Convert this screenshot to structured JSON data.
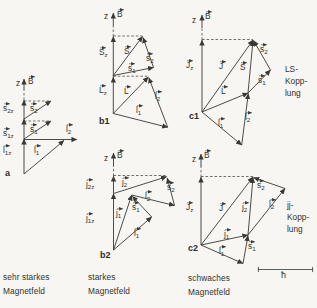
{
  "figure_colors": {
    "background": "#f7f6f2",
    "ink": "#3a3833"
  },
  "captions": [
    {
      "lines": [
        "sehr starkes",
        "Magnetfeld"
      ]
    },
    {
      "lines": [
        "starkes",
        "Magnetfeld"
      ]
    },
    {
      "lines": [
        "schwaches",
        "Magnetfeld"
      ]
    }
  ],
  "coupling": [
    {
      "lines": [
        "LS-",
        "Kopp-",
        "lung"
      ]
    },
    {
      "lines": [
        "jj-",
        "Kopp-",
        "lung"
      ]
    }
  ],
  "scale": {
    "label": "ħ",
    "x1": 258,
    "x2": 313,
    "y": 269.5
  },
  "panels": [
    {
      "id": "a",
      "tag": {
        "text": "a",
        "x": 5,
        "y": 167
      },
      "vectors": [
        {
          "name": "l1z-projection",
          "x1": 24,
          "y1": 174,
          "x2": 24,
          "y2": 139
        },
        {
          "name": "s1z-projection",
          "x1": 24,
          "y1": 139,
          "x2": 24,
          "y2": 119
        },
        {
          "name": "s2z-projection",
          "x1": 24,
          "y1": 119,
          "x2": 24,
          "y2": 100
        },
        {
          "name": "b-field-arrow",
          "x1": 24,
          "y1": 90,
          "x2": 24,
          "y2": 79
        },
        {
          "name": "s2-vector",
          "x1": 24,
          "y1": 119,
          "x2": 51,
          "y2": 101
        },
        {
          "name": "s1-vector",
          "x1": 24,
          "y1": 139,
          "x2": 51,
          "y2": 121
        },
        {
          "name": "l2-vector",
          "x1": 24,
          "y1": 139.5,
          "x2": 77,
          "y2": 139.5
        },
        {
          "name": "l1-vector",
          "x1": 24,
          "y1": 174,
          "x2": 64,
          "y2": 140.5
        }
      ],
      "dashes": [
        {
          "x1": 24,
          "y1": 100,
          "x2": 24,
          "y2": 90
        },
        {
          "x1": 24,
          "y1": 101,
          "x2": 51,
          "y2": 101
        },
        {
          "x1": 24,
          "y1": 121,
          "x2": 51,
          "y2": 121
        }
      ],
      "labels": [
        {
          "name": "z-axis-label",
          "x": 16,
          "y": 77,
          "base": "z"
        },
        {
          "name": "b-field-label",
          "x": 28,
          "y": 75,
          "base": "B",
          "vec": true
        },
        {
          "name": "s2z-label",
          "x": 3,
          "y": 102,
          "base": "s",
          "sub": "2z",
          "vec": true
        },
        {
          "name": "s1z-label",
          "x": 3,
          "y": 127,
          "base": "s",
          "sub": "1z",
          "vec": true
        },
        {
          "name": "l1z-label",
          "x": 3,
          "y": 144,
          "base": "l",
          "sub": "1z",
          "vec": true
        },
        {
          "name": "s2-label",
          "x": 30,
          "y": 102,
          "base": "s",
          "sub": "2",
          "vec": true
        },
        {
          "name": "s1-label",
          "x": 30,
          "y": 123,
          "base": "s",
          "sub": "1",
          "vec": true
        },
        {
          "name": "l2-label",
          "x": 66,
          "y": 123,
          "base": "l",
          "sub": "2",
          "vec": true
        },
        {
          "name": "l1-label",
          "x": 34,
          "y": 144,
          "base": "l",
          "sub": "1",
          "vec": true
        }
      ]
    },
    {
      "id": "b1",
      "tag": {
        "text": "b1",
        "x": 99,
        "y": 115
      },
      "vectors": [
        {
          "name": "Lz-projection",
          "x1": 113.3,
          "y1": 113.5,
          "x2": 113.3,
          "y2": 77
        },
        {
          "name": "Sz-projection",
          "x1": 113.3,
          "y1": 77,
          "x2": 113.3,
          "y2": 36.5
        },
        {
          "name": "b-field-arrow",
          "x1": 113.3,
          "y1": 26,
          "x2": 113.3,
          "y2": 13
        },
        {
          "name": "S-vector",
          "x1": 113.3,
          "y1": 75.5,
          "x2": 142.5,
          "y2": 36.5
        },
        {
          "name": "s1-vector",
          "x1": 113.3,
          "y1": 75.5,
          "x2": 153.5,
          "y2": 67.5
        },
        {
          "name": "s2-vector",
          "x1": 153.5,
          "y1": 67.5,
          "x2": 143,
          "y2": 37.5
        },
        {
          "name": "L-vector",
          "x1": 113.3,
          "y1": 113.5,
          "x2": 148.3,
          "y2": 77
        },
        {
          "name": "l1-vector",
          "x1": 113.3,
          "y1": 113.5,
          "x2": 167.7,
          "y2": 127.3
        },
        {
          "name": "l2-vector",
          "x1": 167.7,
          "y1": 127.3,
          "x2": 148.8,
          "y2": 77.8
        }
      ],
      "dashes": [
        {
          "x1": 113.3,
          "y1": 36.5,
          "x2": 113.3,
          "y2": 26
        },
        {
          "x1": 113.3,
          "y1": 36,
          "x2": 142.5,
          "y2": 36
        },
        {
          "x1": 113.3,
          "y1": 76.2,
          "x2": 148,
          "y2": 76.2
        }
      ],
      "labels": [
        {
          "name": "z-axis-label",
          "x": 104,
          "y": 10,
          "base": "z"
        },
        {
          "name": "b-field-label",
          "x": 117,
          "y": 8,
          "base": "B",
          "vec": true
        },
        {
          "name": "Sz-label",
          "x": 99,
          "y": 46,
          "base": "S",
          "sub": "z",
          "vec": true
        },
        {
          "name": "Lz-label",
          "x": 99,
          "y": 84,
          "base": "L",
          "sub": "z",
          "vec": true
        },
        {
          "name": "S-label",
          "x": 124,
          "y": 45,
          "base": "S",
          "vec": true
        },
        {
          "name": "s1-label",
          "x": 128,
          "y": 62,
          "base": "s",
          "sub": "1",
          "vec": true
        },
        {
          "name": "s2-label",
          "x": 146,
          "y": 52,
          "base": "s",
          "sub": "2",
          "vec": true
        },
        {
          "name": "L-label",
          "x": 124,
          "y": 85,
          "base": "L",
          "vec": true
        },
        {
          "name": "l1-label",
          "x": 136,
          "y": 104,
          "base": "l",
          "sub": "1",
          "vec": true
        },
        {
          "name": "l2-label",
          "x": 155,
          "y": 90,
          "base": "l",
          "sub": "2",
          "vec": true
        }
      ]
    },
    {
      "id": "b2",
      "tag": {
        "text": "b2",
        "x": 100,
        "y": 249
      },
      "vectors": [
        {
          "name": "j1z-projection",
          "x1": 113.5,
          "y1": 250,
          "x2": 113.5,
          "y2": 193.5
        },
        {
          "name": "j2z-projection",
          "x1": 113.5,
          "y1": 193.5,
          "x2": 113.5,
          "y2": 176
        },
        {
          "name": "b-field-arrow",
          "x1": 113.5,
          "y1": 166,
          "x2": 113.5,
          "y2": 153
        },
        {
          "name": "j2-vector",
          "x1": 113.5,
          "y1": 193.5,
          "x2": 166.7,
          "y2": 176.7
        },
        {
          "name": "j1-vector",
          "x1": 113.5,
          "y1": 250,
          "x2": 131.7,
          "y2": 195
        },
        {
          "name": "l2-vector",
          "x1": 131.7,
          "y1": 195,
          "x2": 174.5,
          "y2": 205.5
        },
        {
          "name": "s2-vector",
          "x1": 174.5,
          "y1": 205.5,
          "x2": 167.3,
          "y2": 178
        },
        {
          "name": "l1-vector",
          "x1": 113.5,
          "y1": 250,
          "x2": 151.7,
          "y2": 217
        },
        {
          "name": "s1-vector",
          "x1": 151.7,
          "y1": 217,
          "x2": 132.3,
          "y2": 196.2
        }
      ],
      "dashes": [
        {
          "x1": 113.5,
          "y1": 176,
          "x2": 113.5,
          "y2": 166
        },
        {
          "x1": 113.5,
          "y1": 175.5,
          "x2": 166.5,
          "y2": 175.5
        }
      ],
      "labels": [
        {
          "name": "z-axis-label",
          "x": 104,
          "y": 152,
          "base": "z"
        },
        {
          "name": "b-field-label",
          "x": 117,
          "y": 149,
          "base": "B",
          "vec": true
        },
        {
          "name": "j2z-label",
          "x": 86,
          "y": 178,
          "base": "j",
          "sub": "2z",
          "vec": true
        },
        {
          "name": "j1z-label",
          "x": 86,
          "y": 212,
          "base": "j",
          "sub": "1z",
          "vec": true
        },
        {
          "name": "j2-label",
          "x": 122,
          "y": 176,
          "base": "j",
          "sub": "2",
          "vec": true
        },
        {
          "name": "j1-label",
          "x": 116,
          "y": 207,
          "base": "j",
          "sub": "1",
          "vec": true
        },
        {
          "name": "l2-label",
          "x": 145,
          "y": 190,
          "base": "l",
          "sub": "2",
          "vec": true
        },
        {
          "name": "s2-label",
          "x": 167,
          "y": 181,
          "base": "s",
          "sub": "2",
          "vec": true
        },
        {
          "name": "s1-label",
          "x": 132,
          "y": 201,
          "base": "s",
          "sub": "1",
          "vec": true
        },
        {
          "name": "l1-label",
          "x": 134,
          "y": 227,
          "base": "l",
          "sub": "1",
          "vec": true
        }
      ]
    },
    {
      "id": "c1",
      "tag": {
        "text": "c1",
        "x": 189,
        "y": 110
      },
      "vectors": [
        {
          "name": "Jz-projection",
          "x1": 202,
          "y1": 112,
          "x2": 202,
          "y2": 40
        },
        {
          "name": "b-field-arrow",
          "x1": 202,
          "y1": 28,
          "x2": 202,
          "y2": 15
        },
        {
          "name": "J-vector",
          "x1": 202,
          "y1": 112,
          "x2": 253,
          "y2": 40
        },
        {
          "name": "L-vector",
          "x1": 202,
          "y1": 112,
          "x2": 248,
          "y2": 93
        },
        {
          "name": "S-vector",
          "x1": 248,
          "y1": 93,
          "x2": 253,
          "y2": 40.5
        },
        {
          "name": "l1-vector",
          "x1": 202,
          "y1": 112,
          "x2": 241.7,
          "y2": 145
        },
        {
          "name": "l2-vector",
          "x1": 241.7,
          "y1": 145,
          "x2": 248.3,
          "y2": 93.6
        },
        {
          "name": "s1-vector",
          "x1": 248,
          "y1": 93,
          "x2": 270.5,
          "y2": 70
        },
        {
          "name": "s2-vector",
          "x1": 270.5,
          "y1": 70,
          "x2": 253.6,
          "y2": 40.6
        }
      ],
      "dashes": [
        {
          "x1": 202,
          "y1": 40,
          "x2": 202,
          "y2": 28
        },
        {
          "x1": 202,
          "y1": 39.5,
          "x2": 253,
          "y2": 39.5
        }
      ],
      "labels": [
        {
          "name": "z-axis-label",
          "x": 192,
          "y": 14,
          "base": "z"
        },
        {
          "name": "b-field-label",
          "x": 205,
          "y": 10,
          "base": "B",
          "vec": true
        },
        {
          "name": "Jz-label",
          "x": 186,
          "y": 59,
          "base": "J",
          "sub": "z",
          "vec": true
        },
        {
          "name": "J-label",
          "x": 219,
          "y": 60,
          "base": "J",
          "vec": true
        },
        {
          "name": "S-label",
          "x": 240,
          "y": 61,
          "base": "S",
          "vec": true
        },
        {
          "name": "s2-label",
          "x": 260,
          "y": 43,
          "base": "s",
          "sub": "2",
          "vec": true
        },
        {
          "name": "s1-label",
          "x": 258,
          "y": 74,
          "base": "s",
          "sub": "1",
          "vec": true
        },
        {
          "name": "L-label",
          "x": 221,
          "y": 85,
          "base": "L",
          "vec": true
        },
        {
          "name": "l2-label",
          "x": 245,
          "y": 111,
          "base": "l",
          "sub": "2",
          "vec": true
        },
        {
          "name": "l1-label",
          "x": 218,
          "y": 117,
          "base": "l",
          "sub": "1",
          "vec": true
        }
      ]
    },
    {
      "id": "c2",
      "tag": {
        "text": "c2",
        "x": 188,
        "y": 242
      },
      "vectors": [
        {
          "name": "Jz-projection",
          "x1": 201,
          "y1": 245,
          "x2": 201,
          "y2": 177
        },
        {
          "name": "b-field-arrow",
          "x1": 201,
          "y1": 167,
          "x2": 201,
          "y2": 154
        },
        {
          "name": "J-vector",
          "x1": 201,
          "y1": 245,
          "x2": 253,
          "y2": 177
        },
        {
          "name": "j1-vector",
          "x1": 201,
          "y1": 245,
          "x2": 248,
          "y2": 235
        },
        {
          "name": "j2-vector",
          "x1": 248,
          "y1": 235,
          "x2": 253,
          "y2": 177.6
        },
        {
          "name": "l1-vector",
          "x1": 201,
          "y1": 245,
          "x2": 243,
          "y2": 263.5
        },
        {
          "name": "s1-vector",
          "x1": 243,
          "y1": 263.5,
          "x2": 248,
          "y2": 235.6
        },
        {
          "name": "l2-vector",
          "x1": 248,
          "y1": 235,
          "x2": 285,
          "y2": 188.5
        },
        {
          "name": "s2-vector",
          "x1": 285,
          "y1": 188.5,
          "x2": 253.6,
          "y2": 177.6
        }
      ],
      "dashes": [
        {
          "x1": 201,
          "y1": 177,
          "x2": 201,
          "y2": 167
        },
        {
          "x1": 201,
          "y1": 176.5,
          "x2": 253,
          "y2": 176.5
        }
      ],
      "labels": [
        {
          "name": "z-axis-label",
          "x": 192,
          "y": 153,
          "base": "z"
        },
        {
          "name": "b-field-label",
          "x": 204,
          "y": 149,
          "base": "B",
          "vec": true
        },
        {
          "name": "Jz-label",
          "x": 186,
          "y": 201,
          "base": "J",
          "sub": "z",
          "vec": true
        },
        {
          "name": "J-label",
          "x": 219,
          "y": 202,
          "base": "J",
          "vec": true
        },
        {
          "name": "j2-label",
          "x": 242,
          "y": 201,
          "base": "j",
          "sub": "2",
          "vec": true
        },
        {
          "name": "j1-label",
          "x": 224,
          "y": 228,
          "base": "j",
          "sub": "1",
          "vec": true
        },
        {
          "name": "s2-label",
          "x": 257,
          "y": 179,
          "base": "s",
          "sub": "2",
          "vec": true
        },
        {
          "name": "l2-label",
          "x": 269,
          "y": 198,
          "base": "l",
          "sub": "2",
          "vec": true
        },
        {
          "name": "s1-label",
          "x": 248,
          "y": 240,
          "base": "s",
          "sub": "1",
          "vec": true
        },
        {
          "name": "l1-label",
          "x": 219,
          "y": 245,
          "base": "l",
          "sub": "1",
          "vec": true
        }
      ]
    }
  ]
}
